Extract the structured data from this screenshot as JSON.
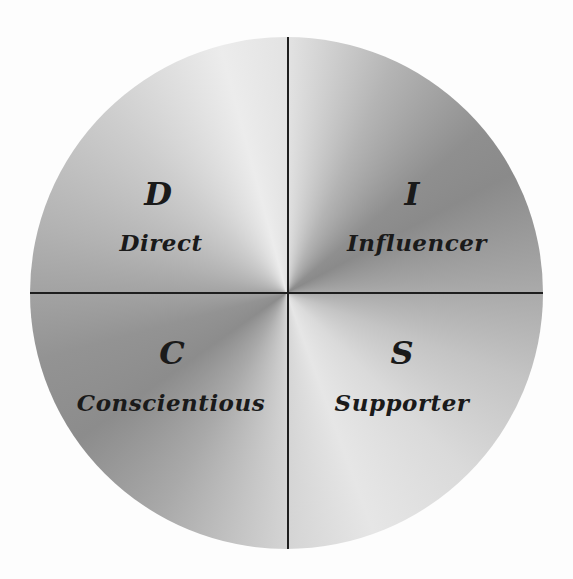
{
  "diagram": {
    "type": "DISC personality wheel",
    "colors": {
      "background": "#ffffff",
      "divider": "#1e1e1e",
      "text": "#1a1a1a",
      "shade_light": "#e6e6e6",
      "shade_dark": "#8a8a8a"
    },
    "quadrants": [
      {
        "position": "top-left",
        "letter": "D",
        "label": "Direct"
      },
      {
        "position": "top-right",
        "letter": "I",
        "label": "Influencer"
      },
      {
        "position": "bottom-left",
        "letter": "C",
        "label": "Conscientious"
      },
      {
        "position": "bottom-right",
        "letter": "S",
        "label": "Supporter"
      }
    ]
  }
}
